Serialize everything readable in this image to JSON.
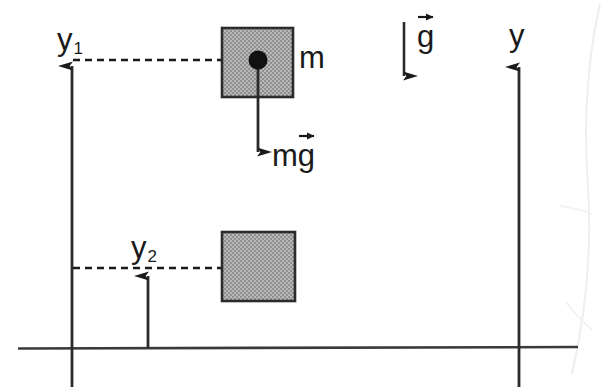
{
  "figure": {
    "background_color": "#ffffff",
    "ink_color": "#1a1a1a",
    "block_fill_color": "#a8a8a8",
    "block_stroke_color": "#2b2b2b",
    "width": 602,
    "height": 387
  },
  "labels": {
    "y1": {
      "text": "y",
      "subscript": "1"
    },
    "y2": {
      "text": "y",
      "subscript": "2"
    },
    "y_axis": {
      "text": "y"
    },
    "mass": {
      "text": "m"
    },
    "weight": {
      "text": "mg",
      "base": "m",
      "vector_symbol": "g"
    },
    "gravity": {
      "text": "g",
      "vector_symbol": "g"
    }
  },
  "elements": {
    "ground_line": {
      "name": "ground-line",
      "x1": 18,
      "y1": 348,
      "x2": 578,
      "y2": 348
    },
    "left_axis": {
      "name": "left-reference-axis",
      "x": 72,
      "y_tip": 52,
      "y_bottom": 387,
      "arrow": "up"
    },
    "right_axis": {
      "name": "y-axis",
      "x": 519,
      "y_tip": 53,
      "y_bottom": 387,
      "arrow": "up"
    },
    "y1_dashed": {
      "name": "y1-dashed-line",
      "y": 60,
      "x1": 73,
      "x2": 258
    },
    "y2_dashed": {
      "name": "y2-dashed-line",
      "y": 268,
      "x1": 73,
      "x2": 228
    },
    "y2_arrow": {
      "name": "y2-measure-arrow",
      "x": 148,
      "y_base": 348,
      "y_tip": 262,
      "arrow": "up"
    },
    "block_upper": {
      "name": "block-upper",
      "x": 222,
      "y": 28,
      "width": 71,
      "height": 69
    },
    "block_lower": {
      "name": "block-lower",
      "x": 222,
      "y": 232,
      "width": 73,
      "height": 69
    },
    "center_dot": {
      "name": "center-of-mass-dot",
      "cx": 258,
      "cy": 60,
      "r": 9
    },
    "mg_arrow": {
      "name": "weight-force-arrow",
      "x": 258,
      "y_base": 60,
      "y_tip": 168,
      "arrow": "down"
    },
    "g_arrow": {
      "name": "gravity-direction-arrow",
      "x": 404,
      "y_base": 22,
      "y_tip": 92,
      "arrow": "down"
    }
  }
}
